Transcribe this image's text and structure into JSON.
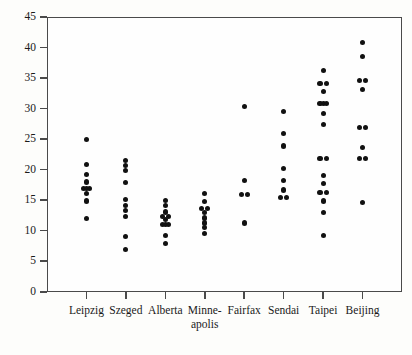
{
  "chart_data": {
    "type": "scatter",
    "title": "",
    "subtitle": "",
    "xlabel": "",
    "ylabel": "",
    "xlim": [
      0,
      9
    ],
    "ylim": [
      0,
      45
    ],
    "grid": false,
    "legend": null,
    "y_ticks": [
      0,
      5,
      10,
      15,
      20,
      25,
      30,
      35,
      40,
      45
    ],
    "y_tick_labels": [
      "0",
      "5",
      "10",
      "15",
      "20",
      "25",
      "30",
      "35",
      "40",
      "45"
    ],
    "categories": [
      "Leipzig",
      "Szeged",
      "Alberta",
      "Minne-apolis",
      "Fairfax",
      "Sendai",
      "Taipei",
      "Beijing"
    ],
    "category_labels": [
      {
        "line1": "Leipzig",
        "line2": ""
      },
      {
        "line1": "Szeged",
        "line2": ""
      },
      {
        "line1": "Alberta",
        "line2": ""
      },
      {
        "line1": "Minne-",
        "line2": "apolis"
      },
      {
        "line1": "Fairfax",
        "line2": ""
      },
      {
        "line1": "Sendai",
        "line2": ""
      },
      {
        "line1": "Taipei",
        "line2": ""
      },
      {
        "line1": "Beijing",
        "line2": ""
      }
    ],
    "marker": {
      "shape": "circle",
      "color": "#111111",
      "size": 5
    },
    "series": [
      {
        "name": "Leipzig",
        "category_index": 0,
        "points": [
          {
            "value": 25.0,
            "offset": 0
          },
          {
            "value": 20.8,
            "offset": 0
          },
          {
            "value": 19.2,
            "offset": 0
          },
          {
            "value": 18.0,
            "offset": 0
          },
          {
            "value": 17.0,
            "offset": -1
          },
          {
            "value": 17.0,
            "offset": 0
          },
          {
            "value": 17.0,
            "offset": 1
          },
          {
            "value": 16.1,
            "offset": 0
          },
          {
            "value": 14.9,
            "offset": 0
          },
          {
            "value": 12.0,
            "offset": 0
          }
        ]
      },
      {
        "name": "Szeged",
        "category_index": 1,
        "points": [
          {
            "value": 21.5,
            "offset": 0
          },
          {
            "value": 20.7,
            "offset": 0
          },
          {
            "value": 19.9,
            "offset": 0
          },
          {
            "value": 17.9,
            "offset": 0
          },
          {
            "value": 15.2,
            "offset": 0
          },
          {
            "value": 14.2,
            "offset": 0
          },
          {
            "value": 13.3,
            "offset": 0
          },
          {
            "value": 12.4,
            "offset": 0
          },
          {
            "value": 9.1,
            "offset": 0
          },
          {
            "value": 7.0,
            "offset": 0
          }
        ]
      },
      {
        "name": "Alberta",
        "category_index": 2,
        "points": [
          {
            "value": 15.0,
            "offset": 0
          },
          {
            "value": 14.1,
            "offset": 0
          },
          {
            "value": 13.1,
            "offset": 0
          },
          {
            "value": 12.3,
            "offset": -1
          },
          {
            "value": 12.3,
            "offset": 1
          },
          {
            "value": 11.8,
            "offset": 0
          },
          {
            "value": 11.1,
            "offset": -1
          },
          {
            "value": 11.1,
            "offset": 0
          },
          {
            "value": 11.1,
            "offset": 1
          },
          {
            "value": 9.2,
            "offset": 0
          },
          {
            "value": 8.0,
            "offset": 0
          }
        ]
      },
      {
        "name": "Minne-apolis",
        "category_index": 3,
        "points": [
          {
            "value": 16.1,
            "offset": 0
          },
          {
            "value": 14.8,
            "offset": 0
          },
          {
            "value": 13.7,
            "offset": -1
          },
          {
            "value": 13.7,
            "offset": 1
          },
          {
            "value": 13.0,
            "offset": 0
          },
          {
            "value": 12.1,
            "offset": 0
          },
          {
            "value": 11.3,
            "offset": 0
          },
          {
            "value": 10.5,
            "offset": 0
          },
          {
            "value": 9.6,
            "offset": 0
          }
        ]
      },
      {
        "name": "Fairfax",
        "category_index": 4,
        "points": [
          {
            "value": 30.3,
            "offset": 0
          },
          {
            "value": 18.3,
            "offset": 0
          },
          {
            "value": 16.0,
            "offset": -1
          },
          {
            "value": 16.0,
            "offset": 1
          },
          {
            "value": 11.3,
            "offset": 0
          }
        ]
      },
      {
        "name": "Sendai",
        "category_index": 5,
        "points": [
          {
            "value": 29.6,
            "offset": 0
          },
          {
            "value": 25.9,
            "offset": 0
          },
          {
            "value": 23.9,
            "offset": 0
          },
          {
            "value": 20.2,
            "offset": 0
          },
          {
            "value": 18.2,
            "offset": 0
          },
          {
            "value": 16.7,
            "offset": 0
          },
          {
            "value": 15.4,
            "offset": -1
          },
          {
            "value": 15.4,
            "offset": 1
          }
        ]
      },
      {
        "name": "Taipei",
        "category_index": 6,
        "points": [
          {
            "value": 36.2,
            "offset": 0
          },
          {
            "value": 34.1,
            "offset": -1
          },
          {
            "value": 34.1,
            "offset": 1
          },
          {
            "value": 32.8,
            "offset": 0
          },
          {
            "value": 30.8,
            "offset": -1
          },
          {
            "value": 30.8,
            "offset": 0
          },
          {
            "value": 30.8,
            "offset": 1
          },
          {
            "value": 29.2,
            "offset": 0
          },
          {
            "value": 27.4,
            "offset": 0
          },
          {
            "value": 21.9,
            "offset": -1
          },
          {
            "value": 21.9,
            "offset": 1
          },
          {
            "value": 19.1,
            "offset": 0
          },
          {
            "value": 17.8,
            "offset": 0
          },
          {
            "value": 16.3,
            "offset": -1
          },
          {
            "value": 16.3,
            "offset": 1
          },
          {
            "value": 14.9,
            "offset": 0
          },
          {
            "value": 13.0,
            "offset": 0
          },
          {
            "value": 9.3,
            "offset": 0
          }
        ]
      },
      {
        "name": "Beijing",
        "category_index": 7,
        "points": [
          {
            "value": 40.8,
            "offset": 0
          },
          {
            "value": 38.6,
            "offset": 0
          },
          {
            "value": 34.6,
            "offset": -1
          },
          {
            "value": 34.6,
            "offset": 1
          },
          {
            "value": 33.2,
            "offset": 0
          },
          {
            "value": 26.9,
            "offset": -1
          },
          {
            "value": 26.9,
            "offset": 1
          },
          {
            "value": 23.7,
            "offset": 0
          },
          {
            "value": 21.8,
            "offset": -1
          },
          {
            "value": 21.8,
            "offset": 1
          },
          {
            "value": 14.6,
            "offset": 0
          }
        ]
      }
    ]
  }
}
